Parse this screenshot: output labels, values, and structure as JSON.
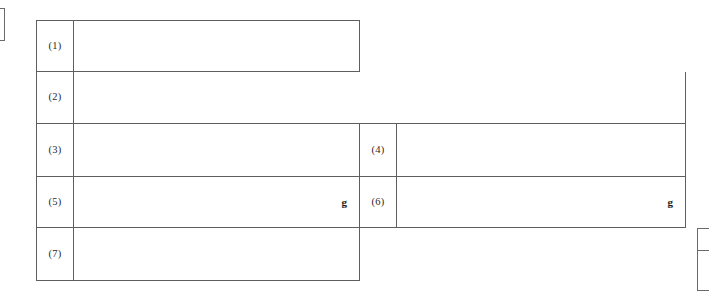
{
  "document": {
    "kind": "scanned-form-table",
    "background_color": "#ffffff",
    "rule_color": "#5e5e5e"
  },
  "form": {
    "rows": [
      {
        "row_id": "row-1",
        "left": {
          "label": "(1)",
          "value": "",
          "unit": ""
        },
        "right": null
      },
      {
        "row_id": "row-2",
        "left": {
          "label": "(2)",
          "value": "",
          "unit": ""
        },
        "right": null
      },
      {
        "row_id": "row-3",
        "left": {
          "label": "(3)",
          "value": "",
          "unit": ""
        },
        "right": {
          "label": "(4)",
          "value": "",
          "unit": ""
        }
      },
      {
        "row_id": "row-4",
        "left": {
          "label": "(5)",
          "value": "",
          "unit": "g"
        },
        "right": {
          "label": "(6)",
          "value": "",
          "unit": "g"
        }
      },
      {
        "row_id": "row-5",
        "left": {
          "label": "(7)",
          "value": "",
          "unit": ""
        },
        "right": null
      }
    ]
  },
  "fragments": {
    "left_edge": "",
    "bottom_right_top": "",
    "bottom_right_bottom": ""
  }
}
